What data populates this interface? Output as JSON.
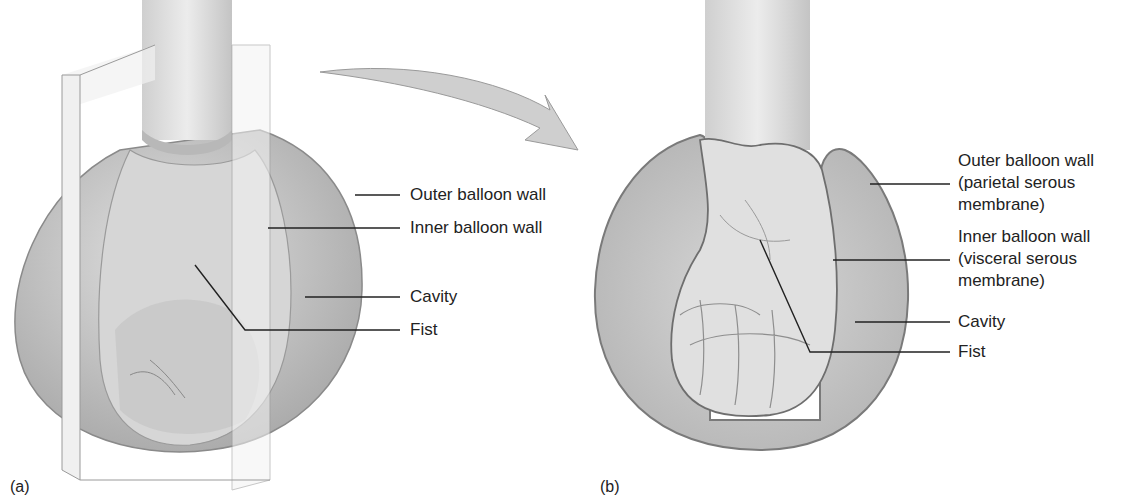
{
  "panels": [
    {
      "id": "a",
      "tag": "(a)",
      "labels": [
        "Outer balloon wall",
        "Inner balloon wall",
        "Cavity",
        "Fist"
      ]
    },
    {
      "id": "b",
      "tag": "(b)",
      "labels": [
        "Outer balloon wall",
        "(parietal serous",
        "membrane)",
        "Inner balloon wall",
        "(visceral serous",
        "membrane)",
        "Cavity",
        "Fist"
      ]
    }
  ],
  "colors": {
    "balloon_fill": "#c9c9c9",
    "balloon_edge": "#8a8a8a",
    "skin": "#dcdcdc",
    "arrow": "#cfcfcf",
    "leader": "#222222"
  }
}
